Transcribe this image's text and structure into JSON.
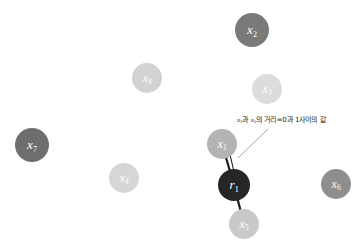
{
  "figure": {
    "title": "",
    "background_color": "#ffffff",
    "width": 358,
    "height": 245
  },
  "annotation": {
    "name": "distance-annotation",
    "text": "x₁과 x₅의 거리=0과 1사이의 값",
    "text_parts": {
      "var1": "x",
      "var1_sub": "1",
      "middle": "과 ",
      "var2": "x",
      "var2_sub": "5",
      "tail": "의 거리=0과 1사이의 값"
    },
    "color": "#1c1c1c",
    "leader_line_color": "#9a9a9a"
  },
  "chart_data": {
    "type": "scatter",
    "title": "",
    "xlabel": "",
    "ylabel": "",
    "grid": false,
    "legend": "none",
    "xlim": [
      0,
      358
    ],
    "ylim": [
      0,
      245
    ],
    "nodes": [
      {
        "id": "x7",
        "label": "x",
        "sub": "7",
        "x": 32,
        "y": 145,
        "r": 17,
        "color": "#6e6e6e",
        "font_size": 13
      },
      {
        "id": "x8",
        "label": "x",
        "sub": "8",
        "x": 147,
        "y": 78,
        "r": 15,
        "color": "#d2d2d2",
        "font_size": 12
      },
      {
        "id": "x2",
        "label": "x",
        "sub": "2",
        "x": 252,
        "y": 30,
        "r": 17,
        "color": "#7a7a7a",
        "font_size": 13
      },
      {
        "id": "x3",
        "label": "x",
        "sub": "3",
        "x": 267,
        "y": 89,
        "r": 15,
        "color": "#dcdcdc",
        "font_size": 12
      },
      {
        "id": "x4",
        "label": "x",
        "sub": "4",
        "x": 124,
        "y": 178,
        "r": 15,
        "color": "#d6d6d6",
        "font_size": 12
      },
      {
        "id": "x1",
        "label": "x",
        "sub": "1",
        "x": 222,
        "y": 144,
        "r": 15,
        "color": "#b4b4b4",
        "font_size": 12
      },
      {
        "id": "r1",
        "label": "r",
        "sub": "1",
        "x": 234,
        "y": 185,
        "r": 16,
        "color": "#262626",
        "font_size": 13
      },
      {
        "id": "x5",
        "label": "x",
        "sub": "5",
        "x": 244,
        "y": 224,
        "r": 15,
        "color": "#c9c9c9",
        "font_size": 12
      },
      {
        "id": "x6",
        "label": "x",
        "sub": "6",
        "x": 336,
        "y": 184,
        "r": 15,
        "color": "#8e8e8e",
        "font_size": 12
      }
    ],
    "edges": [
      {
        "from": "x1",
        "to": "r1",
        "color": "#1a1a1a",
        "width": 2.2
      },
      {
        "from": "r1",
        "to": "x5",
        "color": "#1a1a1a",
        "width": 2.2
      }
    ],
    "measure_arrow": {
      "name": "distance-measure-arrow",
      "x1": 229,
      "y1": 150,
      "x2": 234,
      "y2": 172,
      "color": "#1a1a1a",
      "double_headed": true
    },
    "leader_line": {
      "from_x": 238,
      "from_y": 158,
      "to_x": 268,
      "to_y": 129,
      "color": "#9a9a9a"
    }
  }
}
